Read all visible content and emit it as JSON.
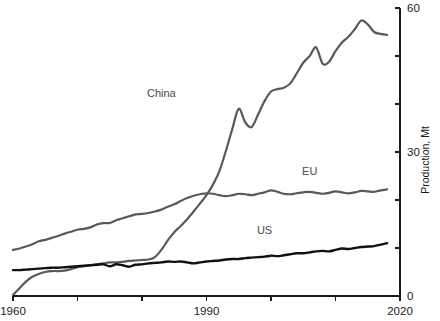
{
  "chart_data": {
    "type": "line",
    "title": "",
    "xlabel": "",
    "ylabel": "Production, Mt",
    "xlim": [
      1960,
      2020
    ],
    "ylim": [
      0,
      60
    ],
    "grid": false,
    "legend_position": "inline-labels",
    "x_ticks": [
      1960,
      1970,
      1980,
      1990,
      2000,
      2010,
      2020
    ],
    "x_tick_labels": [
      "1960",
      "",
      "",
      "1990",
      "",
      "",
      "2020"
    ],
    "y_ticks": [
      0,
      10,
      20,
      30,
      40,
      50,
      60
    ],
    "y_tick_labels": [
      "0",
      "",
      "",
      "30",
      "",
      "",
      "60"
    ],
    "y_axis_side": "right",
    "x": [
      1960,
      1961,
      1962,
      1963,
      1964,
      1965,
      1966,
      1967,
      1968,
      1969,
      1970,
      1971,
      1972,
      1973,
      1974,
      1975,
      1976,
      1977,
      1978,
      1979,
      1980,
      1981,
      1982,
      1983,
      1984,
      1985,
      1986,
      1987,
      1988,
      1989,
      1990,
      1991,
      1992,
      1993,
      1994,
      1995,
      1996,
      1997,
      1998,
      1999,
      2000,
      2001,
      2002,
      2003,
      2004,
      2005,
      2006,
      2007,
      2008,
      2009,
      2010,
      2011,
      2012,
      2013,
      2014,
      2015,
      2016,
      2017,
      2018
    ],
    "series": [
      {
        "name": "China",
        "color": "#595959",
        "width": 2.2,
        "label_x": 1983,
        "label_y": 41.5,
        "values": [
          0.2,
          1.6,
          3.0,
          4.0,
          4.6,
          5.0,
          5.2,
          5.2,
          5.3,
          5.6,
          6.0,
          6.2,
          6.4,
          6.6,
          6.8,
          7.0,
          7.0,
          7.1,
          7.3,
          7.4,
          7.5,
          7.6,
          8.1,
          9.6,
          11.6,
          13.3,
          14.6,
          16.0,
          17.6,
          19.3,
          21.0,
          23.2,
          26.0,
          30.2,
          34.8,
          39.0,
          36.2,
          35.2,
          37.8,
          40.6,
          42.6,
          43.1,
          43.4,
          44.3,
          46.4,
          48.6,
          50.0,
          51.8,
          48.4,
          48.8,
          51.0,
          52.8,
          54.0,
          55.6,
          57.4,
          56.6,
          55.0,
          54.6,
          54.4
        ]
      },
      {
        "name": "EU",
        "color": "#595959",
        "width": 2.2,
        "label_x": 2006,
        "label_y": 25.2,
        "values": [
          9.6,
          9.9,
          10.3,
          10.8,
          11.4,
          11.7,
          12.1,
          12.5,
          13.0,
          13.4,
          13.8,
          14.0,
          14.3,
          14.9,
          15.2,
          15.2,
          15.8,
          16.2,
          16.6,
          17.0,
          17.1,
          17.3,
          17.6,
          18.0,
          18.6,
          19.1,
          19.8,
          20.4,
          20.9,
          21.2,
          21.4,
          21.3,
          21.0,
          20.8,
          21.0,
          21.3,
          21.2,
          21.0,
          21.3,
          21.6,
          22.0,
          21.7,
          21.3,
          21.2,
          21.4,
          21.6,
          21.7,
          21.5,
          21.3,
          21.5,
          21.8,
          21.6,
          21.4,
          21.6,
          21.9,
          21.8,
          21.7,
          22.0,
          22.2
        ]
      },
      {
        "name": "US",
        "color": "#111111",
        "width": 2.4,
        "label_x": 1999,
        "label_y": 13.0,
        "values": [
          5.4,
          5.4,
          5.5,
          5.6,
          5.7,
          5.8,
          5.9,
          5.9,
          6.0,
          6.1,
          6.2,
          6.3,
          6.4,
          6.5,
          6.6,
          6.2,
          6.6,
          6.4,
          6.1,
          6.5,
          6.6,
          6.8,
          6.9,
          7.0,
          7.2,
          7.1,
          7.2,
          7.0,
          6.8,
          7.0,
          7.2,
          7.3,
          7.4,
          7.6,
          7.7,
          7.7,
          7.9,
          8.0,
          8.1,
          8.2,
          8.4,
          8.3,
          8.5,
          8.7,
          8.9,
          8.9,
          9.1,
          9.3,
          9.4,
          9.3,
          9.6,
          9.9,
          9.8,
          10.0,
          10.2,
          10.3,
          10.4,
          10.7,
          11.0
        ]
      }
    ]
  }
}
